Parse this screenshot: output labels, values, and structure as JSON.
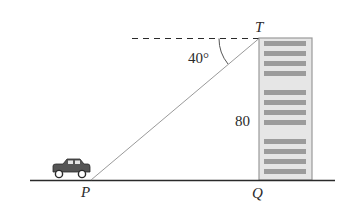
{
  "diagram": {
    "type": "angle-of-depression",
    "points": {
      "T": {
        "label": "T",
        "description": "top of building"
      },
      "Q": {
        "label": "Q",
        "description": "base of building"
      },
      "P": {
        "label": "P",
        "description": "car position on ground"
      }
    },
    "angle_label": "40°",
    "height_label": "80",
    "objects": {
      "car": "car-icon",
      "building": "building-icon"
    },
    "colors": {
      "ink": "#2a2a2a",
      "building_fill": "#e6e6e6",
      "building_outline": "#9a9a9a",
      "window_fill": "#9c9c9c",
      "sightline": "#9a9a9a",
      "car_body": "#555555"
    }
  }
}
